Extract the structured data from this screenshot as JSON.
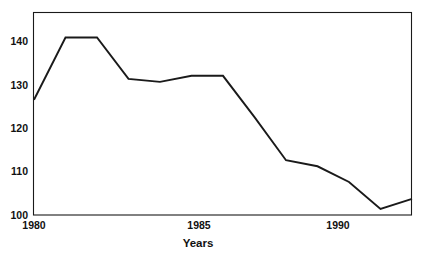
{
  "chart_data": {
    "type": "line",
    "title": "",
    "xlabel": "Years",
    "ylabel": "",
    "x": [
      1980,
      1981,
      1982,
      1983,
      1984,
      1985,
      1986,
      1987,
      1988,
      1989,
      1990,
      1991,
      1992
    ],
    "values": [
      126.5,
      140.8,
      140.8,
      131.3,
      130.6,
      132.0,
      132.0,
      122.5,
      112.6,
      111.2,
      107.6,
      101.4,
      103.7
    ],
    "series": [
      {
        "name": "",
        "values": [
          126.5,
          140.8,
          140.8,
          131.3,
          130.6,
          132.0,
          132.0,
          122.5,
          112.6,
          111.2,
          107.6,
          101.4,
          103.7
        ]
      }
    ],
    "xlim": [
      1980,
      1992
    ],
    "ylim": [
      100,
      146
    ],
    "xticks": [
      1980,
      1985,
      1990
    ],
    "xtick_labels": [
      "1980",
      "1985",
      "1990"
    ],
    "yticks": [
      100,
      110,
      120,
      130,
      140
    ],
    "ytick_labels": [
      "100",
      "110",
      "120",
      "130",
      "140"
    ],
    "grid": false,
    "legend": null,
    "line_color": "#1a1a1a",
    "frame_color": "#1a1a1a",
    "background": "#ffffff"
  }
}
